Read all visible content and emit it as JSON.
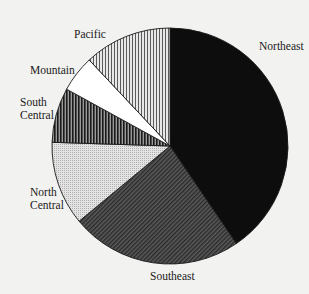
{
  "chart_data": {
    "type": "pie",
    "title": "",
    "start_angle_deg": 0,
    "direction": "clockwise",
    "legend": "none (direct slice labels)",
    "categories": [
      "Northeast",
      "Southeast",
      "North Central",
      "South Central",
      "Mountain",
      "Pacific"
    ],
    "values": [
      40.5,
      23.5,
      11.5,
      7.5,
      5.0,
      12.0
    ],
    "unit": "percent (estimated from slice angles)",
    "slices": [
      {
        "label": "Northeast",
        "value": 40.5,
        "pattern": "solid-black"
      },
      {
        "label": "Southeast",
        "value": 23.5,
        "pattern": "dense-diagonal-hatch"
      },
      {
        "label": "North Central",
        "value": 11.5,
        "pattern": "light-stipple"
      },
      {
        "label": "South Central",
        "value": 7.5,
        "pattern": "dark-vertical-stripes"
      },
      {
        "label": "Mountain",
        "value": 5.0,
        "pattern": "white"
      },
      {
        "label": "Pacific",
        "value": 12.0,
        "pattern": "light-vertical-stripes"
      }
    ]
  },
  "labels": {
    "northeast": "Northeast",
    "southeast": "Southeast",
    "north_central": "North\nCentral",
    "south_central": "South\nCentral",
    "mountain": "Mountain",
    "pacific": "Pacific"
  },
  "colors": {
    "background": "#f2f2f0",
    "outline": "#1a1a1a",
    "northeast": "#0d0d0d",
    "southeast_base": "#5a5a5a",
    "southeast_line": "#2a2a2a",
    "north_central_base": "#e4e4e4",
    "north_central_dot": "#b0b0b0",
    "south_central_base": "#9a9a9a",
    "south_central_line": "#1a1a1a",
    "mountain": "#ffffff",
    "pacific_base": "#e8e8e8",
    "pacific_line": "#5a5a5a"
  }
}
